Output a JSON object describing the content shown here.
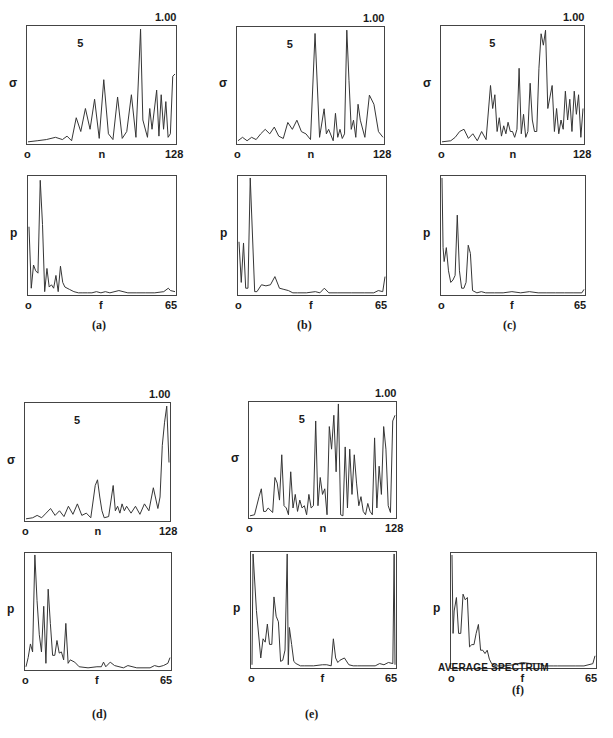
{
  "figure": {
    "panels": [
      {
        "id": "a",
        "caption": "(a)"
      },
      {
        "id": "b",
        "caption": "(b)"
      },
      {
        "id": "c",
        "caption": "(c)"
      },
      {
        "id": "d",
        "caption": "(d)"
      },
      {
        "id": "e",
        "caption": "(e)"
      },
      {
        "id": "f",
        "caption": "(f)",
        "subtitle": "AVERAGE SPECTRUM"
      }
    ],
    "sigma_plot": {
      "ylabel": "σ",
      "xlabel": "n",
      "x_min": "o",
      "x_max": "128",
      "y_max_label": "1.00",
      "annotation": "5"
    },
    "spectrum_plot": {
      "ylabel": "p",
      "xlabel": "f",
      "x_min": "o",
      "x_max": "65"
    }
  },
  "chart_data": [
    {
      "panel": "a",
      "type": "line",
      "title": "",
      "xlabel": "n",
      "ylabel": "σ",
      "xlim": [
        0,
        128
      ],
      "ylim": [
        0,
        1.0
      ],
      "annotations": [
        "5",
        "1.00"
      ],
      "x": [
        0,
        8,
        16,
        24,
        30,
        34,
        38,
        42,
        46,
        50,
        54,
        58,
        62,
        66,
        70,
        74,
        78,
        82,
        86,
        90,
        94,
        98,
        100,
        104,
        106,
        108,
        112,
        114,
        116,
        118,
        120,
        122,
        124,
        126,
        128
      ],
      "y": [
        0.01,
        0.02,
        0.03,
        0.05,
        0.03,
        0.06,
        0.02,
        0.22,
        0.1,
        0.3,
        0.12,
        0.38,
        0.04,
        0.55,
        0.08,
        0.03,
        0.4,
        0.04,
        0.1,
        0.42,
        0.05,
        0.99,
        0.2,
        0.05,
        0.3,
        0.12,
        0.46,
        0.06,
        0.42,
        0.12,
        0.36,
        0.05,
        0.08,
        0.58,
        0.6
      ]
    },
    {
      "panel": "a-spectrum",
      "type": "line",
      "xlabel": "f",
      "ylabel": "p",
      "xlim": [
        0,
        65
      ],
      "ylim": [
        0,
        1.0
      ],
      "x": [
        0,
        1,
        2,
        3,
        4,
        5,
        6,
        7,
        8,
        9,
        10,
        11,
        12,
        13,
        14,
        15,
        16,
        18,
        20,
        22,
        24,
        26,
        28,
        30,
        32,
        34,
        36,
        40,
        44,
        48,
        52,
        56,
        60,
        62,
        63,
        65
      ],
      "y": [
        0.58,
        0.05,
        0.25,
        0.2,
        0.18,
        0.98,
        0.6,
        0.02,
        0.22,
        0.06,
        0.08,
        0.05,
        0.16,
        0.02,
        0.24,
        0.1,
        0.06,
        0.04,
        0.02,
        0.01,
        0.01,
        0.01,
        0.01,
        0.02,
        0.01,
        0.02,
        0.01,
        0.03,
        0.01,
        0.01,
        0.01,
        0.01,
        0.02,
        0.05,
        0.03,
        0.02
      ]
    },
    {
      "panel": "b",
      "type": "line",
      "xlabel": "n",
      "ylabel": "σ",
      "xlim": [
        0,
        128
      ],
      "ylim": [
        0,
        1.0
      ],
      "annotations": [
        "5",
        "1.00"
      ],
      "x": [
        0,
        4,
        8,
        12,
        16,
        20,
        24,
        28,
        32,
        36,
        40,
        44,
        48,
        52,
        56,
        60,
        64,
        68,
        72,
        76,
        78,
        80,
        84,
        86,
        88,
        90,
        92,
        94,
        96,
        98,
        100,
        102,
        104,
        106,
        108,
        112,
        116,
        120,
        124,
        128
      ],
      "y": [
        0.02,
        0.05,
        0.02,
        0.05,
        0.03,
        0.08,
        0.12,
        0.08,
        0.14,
        0.06,
        0.04,
        0.18,
        0.12,
        0.2,
        0.1,
        0.08,
        0.03,
        0.96,
        0.05,
        0.3,
        0.08,
        0.12,
        0.02,
        0.26,
        0.05,
        0.12,
        0.04,
        0.08,
        0.99,
        0.55,
        0.12,
        0.2,
        0.05,
        0.34,
        0.2,
        0.05,
        0.42,
        0.34,
        0.1,
        0.05
      ]
    },
    {
      "panel": "b-spectrum",
      "type": "line",
      "xlabel": "f",
      "ylabel": "p",
      "xlim": [
        0,
        65
      ],
      "ylim": [
        0,
        1.0
      ],
      "x": [
        0,
        1,
        2,
        3,
        4,
        5,
        6,
        7,
        8,
        10,
        12,
        14,
        16,
        18,
        20,
        22,
        24,
        26,
        30,
        34,
        36,
        38,
        40,
        44,
        50,
        56,
        60,
        62,
        64,
        65
      ],
      "y": [
        0.45,
        0.1,
        0.44,
        0.05,
        0.05,
        1.0,
        0.5,
        0.02,
        0.02,
        0.08,
        0.07,
        0.08,
        0.15,
        0.05,
        0.04,
        0.03,
        0.01,
        0.01,
        0.01,
        0.02,
        0.01,
        0.05,
        0.01,
        0.01,
        0.01,
        0.01,
        0.01,
        0.03,
        0.02,
        0.15
      ]
    },
    {
      "panel": "c",
      "type": "line",
      "xlabel": "n",
      "ylabel": "σ",
      "xlim": [
        0,
        128
      ],
      "ylim": [
        0,
        1.0
      ],
      "annotations": [
        "5",
        "1.00"
      ],
      "x": [
        0,
        8,
        12,
        16,
        20,
        24,
        28,
        32,
        36,
        40,
        44,
        46,
        48,
        50,
        52,
        54,
        56,
        58,
        60,
        62,
        64,
        66,
        68,
        70,
        72,
        74,
        76,
        78,
        80,
        82,
        84,
        86,
        88,
        90,
        92,
        94,
        96,
        98,
        100,
        102,
        104,
        106,
        108,
        110,
        112,
        114,
        116,
        118,
        120,
        122,
        124,
        126,
        128
      ],
      "y": [
        0.01,
        0.02,
        0.05,
        0.1,
        0.12,
        0.04,
        0.08,
        0.02,
        0.1,
        0.03,
        0.5,
        0.3,
        0.42,
        0.1,
        0.22,
        0.06,
        0.15,
        0.08,
        0.18,
        0.1,
        0.1,
        0.05,
        0.12,
        0.65,
        0.08,
        0.25,
        0.05,
        0.1,
        0.52,
        0.2,
        0.1,
        0.1,
        0.65,
        0.95,
        0.85,
        0.98,
        0.3,
        0.4,
        0.5,
        0.1,
        0.3,
        0.08,
        0.2,
        0.12,
        0.45,
        0.2,
        0.38,
        0.1,
        0.45,
        0.25,
        0.42,
        0.05,
        0.3
      ]
    },
    {
      "panel": "c-spectrum",
      "type": "line",
      "xlabel": "f",
      "ylabel": "p",
      "xlim": [
        0,
        65
      ],
      "ylim": [
        0,
        1.0
      ],
      "x": [
        0,
        0.5,
        1,
        2,
        3,
        4,
        5,
        6,
        7,
        8,
        9,
        10,
        11,
        12,
        13,
        14,
        16,
        18,
        20,
        24,
        28,
        32,
        36,
        40,
        44,
        48,
        52,
        56,
        60,
        64,
        65
      ],
      "y": [
        1.0,
        0.4,
        0.28,
        0.4,
        0.2,
        0.1,
        0.12,
        0.16,
        0.68,
        0.2,
        0.05,
        0.05,
        0.1,
        0.42,
        0.35,
        0.03,
        0.01,
        0.02,
        0.01,
        0.01,
        0.01,
        0.02,
        0.01,
        0.02,
        0.01,
        0.01,
        0.01,
        0.01,
        0.01,
        0.01,
        0.04
      ]
    },
    {
      "panel": "d",
      "type": "line",
      "xlabel": "n",
      "ylabel": "σ",
      "xlim": [
        0,
        128
      ],
      "ylim": [
        0,
        1.0
      ],
      "annotations": [
        "5",
        "1.00"
      ],
      "x": [
        0,
        6,
        10,
        14,
        18,
        22,
        26,
        30,
        34,
        38,
        42,
        46,
        50,
        54,
        58,
        62,
        64,
        66,
        68,
        70,
        74,
        78,
        80,
        82,
        84,
        86,
        88,
        90,
        94,
        98,
        102,
        106,
        110,
        114,
        118,
        120,
        122,
        124,
        126,
        128
      ],
      "y": [
        0.01,
        0.02,
        0.04,
        0.02,
        0.06,
        0.1,
        0.04,
        0.08,
        0.03,
        0.12,
        0.05,
        0.14,
        0.04,
        0.06,
        0.02,
        0.3,
        0.35,
        0.2,
        0.08,
        0.02,
        0.03,
        0.3,
        0.08,
        0.12,
        0.06,
        0.14,
        0.08,
        0.12,
        0.06,
        0.12,
        0.05,
        0.14,
        0.08,
        0.28,
        0.1,
        0.2,
        0.65,
        0.85,
        0.99,
        0.5
      ]
    },
    {
      "panel": "d-spectrum",
      "type": "line",
      "xlabel": "f",
      "ylabel": "p",
      "xlim": [
        0,
        65
      ],
      "ylim": [
        0,
        1.0
      ],
      "x": [
        0,
        1,
        2,
        3,
        4,
        5,
        6,
        7,
        8,
        9,
        10,
        11,
        12,
        13,
        14,
        15,
        16,
        17,
        18,
        19,
        20,
        22,
        24,
        28,
        32,
        34,
        35,
        36,
        38,
        40,
        44,
        46,
        50,
        56,
        58,
        60,
        62,
        64,
        65
      ],
      "y": [
        0.02,
        0.1,
        0.22,
        0.15,
        1.0,
        0.6,
        0.3,
        0.15,
        0.55,
        0.05,
        0.7,
        0.4,
        0.12,
        0.12,
        0.25,
        0.14,
        0.15,
        0.08,
        0.4,
        0.05,
        0.08,
        0.06,
        0.02,
        0.01,
        0.02,
        0.02,
        0.06,
        0.02,
        0.06,
        0.03,
        0.01,
        0.03,
        0.01,
        0.01,
        0.03,
        0.02,
        0.03,
        0.05,
        0.1
      ]
    },
    {
      "panel": "e",
      "type": "line",
      "xlabel": "n",
      "ylabel": "σ",
      "xlim": [
        0,
        128
      ],
      "ylim": [
        0,
        1.0
      ],
      "annotations": [
        "5",
        "1.00"
      ],
      "x": [
        0,
        4,
        8,
        10,
        12,
        14,
        16,
        20,
        22,
        24,
        26,
        28,
        30,
        32,
        34,
        36,
        38,
        40,
        42,
        44,
        46,
        48,
        50,
        52,
        54,
        56,
        58,
        60,
        62,
        64,
        66,
        68,
        70,
        72,
        74,
        76,
        78,
        80,
        82,
        84,
        86,
        88,
        90,
        92,
        94,
        96,
        98,
        100,
        102,
        104,
        106,
        108,
        110,
        112,
        114,
        116,
        118,
        120,
        122,
        124,
        126,
        128
      ],
      "y": [
        0.01,
        0.02,
        0.18,
        0.25,
        0.05,
        0.05,
        0.08,
        0.04,
        0.35,
        0.3,
        0.15,
        0.55,
        0.1,
        0.08,
        0.02,
        0.4,
        0.08,
        0.2,
        0.05,
        0.15,
        0.08,
        0.1,
        0.02,
        0.2,
        0.08,
        0.1,
        0.85,
        0.1,
        0.35,
        0.2,
        0.25,
        0.02,
        0.8,
        0.6,
        0.9,
        0.4,
        1.0,
        0.02,
        0.01,
        0.62,
        0.08,
        0.6,
        0.2,
        0.55,
        0.3,
        0.1,
        0.18,
        0.05,
        0.02,
        0.12,
        0.05,
        0.02,
        0.7,
        0.08,
        0.45,
        0.2,
        0.8,
        0.6,
        0.1,
        0.04,
        0.85,
        0.9
      ]
    },
    {
      "panel": "e-spectrum",
      "type": "line",
      "xlabel": "f",
      "ylabel": "p",
      "xlim": [
        0,
        65
      ],
      "ylim": [
        0,
        1.0
      ],
      "x": [
        0,
        0.5,
        2,
        4,
        5,
        6,
        7,
        8,
        9,
        10,
        11,
        12,
        13,
        14,
        15,
        16,
        16.5,
        17,
        18,
        19,
        20,
        22,
        24,
        28,
        32,
        34,
        36,
        37,
        38,
        39,
        40,
        42,
        44,
        46,
        48,
        50,
        56,
        58,
        60,
        62,
        64,
        64.6,
        65
      ],
      "y": [
        0.02,
        1.0,
        0.5,
        0.08,
        0.25,
        0.22,
        0.38,
        0.2,
        0.2,
        0.62,
        0.45,
        0.4,
        0.05,
        0.06,
        0.15,
        1.0,
        0.02,
        0.35,
        0.2,
        0.05,
        0.03,
        0.01,
        0.01,
        0.01,
        0.02,
        0.02,
        0.01,
        0.25,
        0.08,
        0.04,
        0.06,
        0.08,
        0.02,
        0.01,
        0.01,
        0.01,
        0.01,
        0.03,
        0.02,
        0.04,
        0.03,
        1.0,
        0.02
      ]
    },
    {
      "panel": "f",
      "type": "line",
      "title": "AVERAGE SPECTRUM",
      "xlabel": "f",
      "ylabel": "p",
      "xlim": [
        0,
        65
      ],
      "ylim": [
        0,
        1.0
      ],
      "x": [
        0,
        0.5,
        1,
        2,
        3,
        4,
        5,
        6,
        7,
        8,
        9,
        10,
        11,
        12,
        13,
        14,
        15,
        16,
        17,
        18,
        20,
        22,
        24,
        28,
        32,
        36,
        40,
        42,
        44,
        46,
        48,
        50,
        56,
        60,
        64,
        65
      ],
      "y": [
        1.0,
        0.3,
        0.5,
        0.62,
        0.3,
        0.3,
        0.65,
        0.6,
        0.62,
        0.18,
        0.2,
        0.2,
        0.3,
        0.38,
        0.15,
        0.15,
        0.12,
        0.15,
        0.07,
        0.03,
        0.01,
        0.01,
        0.01,
        0.02,
        0.04,
        0.03,
        0.03,
        0.01,
        0.01,
        0.01,
        0.01,
        0.01,
        0.01,
        0.01,
        0.03,
        0.1
      ]
    }
  ]
}
